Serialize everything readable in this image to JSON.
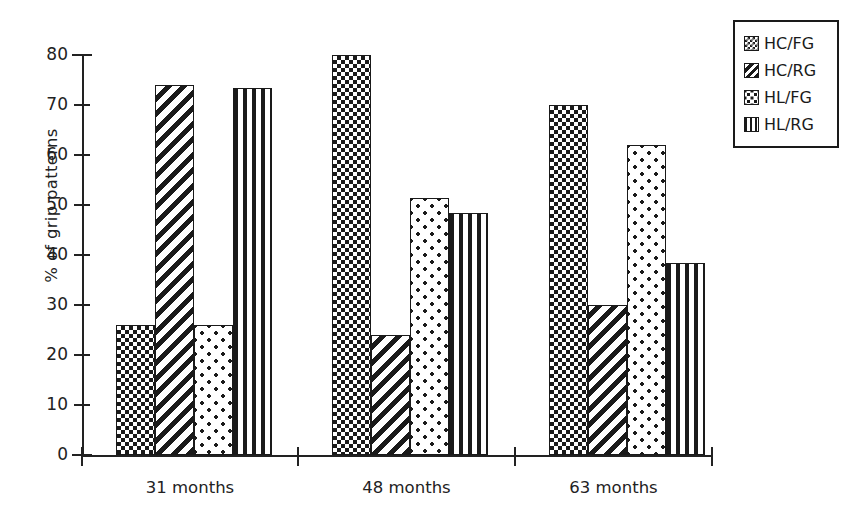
{
  "chart_data": {
    "type": "bar",
    "title": "",
    "xlabel": "",
    "ylabel": "% of grip patterns",
    "ylim": [
      0,
      80
    ],
    "yticks": [
      0,
      10,
      20,
      30,
      40,
      50,
      60,
      70,
      80
    ],
    "ytick_labels": [
      "0",
      "10",
      "20",
      "30",
      "40",
      "50",
      "60",
      "70",
      "80"
    ],
    "grid": false,
    "legend_position": "outside-top-right",
    "categories": [
      "31 months",
      "48 months",
      "63 months"
    ],
    "series": [
      {
        "name": "HC/FG",
        "pattern": "dense-cross-hatch",
        "values": [
          26,
          80,
          70
        ]
      },
      {
        "name": "HC/RG",
        "pattern": "diagonal-stripes",
        "values": [
          74,
          24,
          30
        ]
      },
      {
        "name": "HL/FG",
        "pattern": "sparse-dots",
        "values": [
          26,
          51.5,
          62
        ]
      },
      {
        "name": "HL/RG",
        "pattern": "vertical-stripes",
        "values": [
          73.5,
          48.5,
          38.5
        ]
      }
    ],
    "colors": {
      "ink": "#1a1a1a",
      "background": "#ffffff"
    }
  },
  "legend": {
    "entries": [
      {
        "label": "HC/FG"
      },
      {
        "label": "HC/RG"
      },
      {
        "label": "HL/FG"
      },
      {
        "label": "HL/RG"
      }
    ]
  }
}
